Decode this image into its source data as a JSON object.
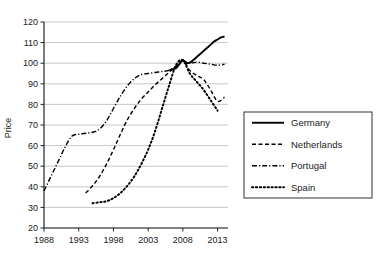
{
  "chart_data": {
    "type": "line",
    "title": "",
    "xlabel": "",
    "ylabel": "Price",
    "xlim": [
      1988,
      2014.5
    ],
    "ylim": [
      20,
      120
    ],
    "grid": true,
    "grid_axis": "y",
    "legend_position": "right",
    "ytick_labels": [
      "120",
      "110",
      "100",
      "90",
      "80",
      "70",
      "60",
      "50",
      "40",
      "30",
      "20"
    ],
    "yticks": [
      120,
      110,
      100,
      90,
      80,
      70,
      60,
      50,
      40,
      30,
      20
    ],
    "xtick_labels": [
      "1988",
      "1993",
      "1998",
      "2003",
      "2008",
      "2013"
    ],
    "xticks": [
      1988,
      1993,
      1998,
      2003,
      2008,
      2013
    ],
    "series": [
      {
        "name": "Germany",
        "style": "solid",
        "color": "#000000",
        "x": [
          2006,
          2006.5,
          2007,
          2007.5,
          2008,
          2008.5,
          2009,
          2009.5,
          2010,
          2010.5,
          2011,
          2011.5,
          2012,
          2012.5,
          2013,
          2013.5,
          2014
        ],
        "values": [
          96.5,
          97.0,
          97.5,
          99.5,
          101.5,
          100.0,
          100.3,
          101.5,
          103.0,
          104.5,
          106.0,
          107.5,
          109.0,
          110.5,
          111.5,
          112.5,
          113.0
        ]
      },
      {
        "name": "Netherlands",
        "style": "dashed",
        "color": "#000000",
        "x": [
          1994,
          1995,
          1996,
          1997,
          1998,
          1999,
          2000,
          2001,
          2002,
          2003,
          2004,
          2005,
          2006,
          2007,
          2008,
          2009,
          2010,
          2011,
          2012,
          2013,
          2014
        ],
        "values": [
          37.0,
          40.5,
          45.0,
          51.0,
          58.0,
          65.5,
          72.5,
          78.0,
          82.5,
          86.0,
          89.5,
          92.5,
          95.5,
          98.5,
          101.0,
          96.5,
          94.0,
          92.0,
          87.0,
          81.5,
          83.5
        ]
      },
      {
        "name": "Portugal",
        "style": "dashdot",
        "color": "#000000",
        "x": [
          1988,
          1989,
          1990,
          1991,
          1992,
          1993,
          1994,
          1995,
          1996,
          1997,
          1998,
          1999,
          2000,
          2001,
          2002,
          2003,
          2004,
          2005,
          2006,
          2007,
          2008,
          2009,
          2010,
          2011,
          2012,
          2013,
          2014
        ],
        "values": [
          38.0,
          45.0,
          52.0,
          59.0,
          64.5,
          65.5,
          66.0,
          66.5,
          68.0,
          72.0,
          78.0,
          84.0,
          89.0,
          92.5,
          94.5,
          95.0,
          95.5,
          96.0,
          96.5,
          98.5,
          101.0,
          100.0,
          100.5,
          100.0,
          99.5,
          99.0,
          99.5
        ]
      },
      {
        "name": "Spain",
        "style": "dotted",
        "color": "#000000",
        "x": [
          1995,
          1996,
          1997,
          1998,
          1999,
          2000,
          2001,
          2002,
          2003,
          2004,
          2005,
          2006,
          2007,
          2008,
          2009,
          2010,
          2011,
          2012,
          2013
        ],
        "values": [
          32.0,
          32.5,
          33.0,
          34.5,
          37.0,
          40.5,
          45.0,
          51.0,
          58.0,
          67.0,
          78.0,
          89.0,
          99.0,
          101.5,
          95.0,
          91.0,
          87.0,
          82.0,
          77.0
        ]
      }
    ]
  },
  "legend": {
    "items": [
      {
        "label": "Germany",
        "style": "solid"
      },
      {
        "label": "Netherlands",
        "style": "dashed"
      },
      {
        "label": "Portugal",
        "style": "dashdot"
      },
      {
        "label": "Spain",
        "style": "dotted"
      }
    ]
  }
}
